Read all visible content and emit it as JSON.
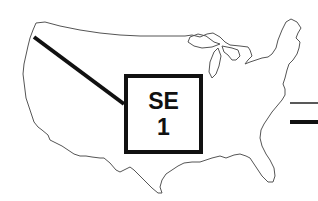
{
  "diagram": {
    "title": "",
    "map": "United States outline",
    "label_box": {
      "line1": "SE",
      "line2": "1"
    },
    "legend": [
      {
        "style": "thin-line",
        "label": ""
      },
      {
        "style": "thick-line",
        "label": ""
      }
    ],
    "colors": {
      "outline": "#555555",
      "leader": "#111111"
    }
  }
}
